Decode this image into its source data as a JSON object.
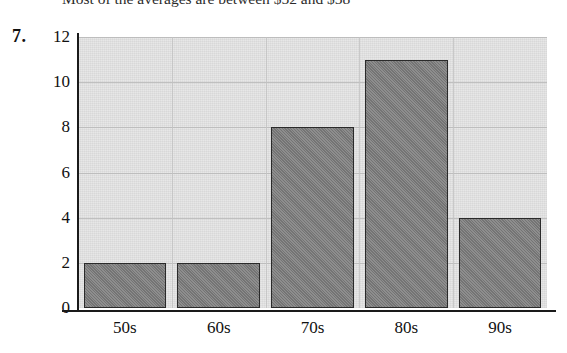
{
  "page": {
    "top_sentence": "Most of the averages are between $52 and $58",
    "problem_number": "7."
  },
  "chart_data": {
    "type": "bar",
    "title": "",
    "xlabel": "",
    "ylabel": "",
    "categories": [
      "50s",
      "60s",
      "70s",
      "80s",
      "90s"
    ],
    "values": [
      2,
      2,
      8,
      11,
      4
    ],
    "ylim": [
      0,
      12
    ],
    "yticks": [
      0,
      2,
      4,
      6,
      8,
      10,
      12
    ],
    "ytick_labels": [
      "0",
      "2",
      "4",
      "6",
      "8",
      "10",
      "12"
    ],
    "grid": true,
    "legend": null,
    "colors": {
      "bar_fill": "#7d7d7d",
      "bar_edge": "#2a2a2a",
      "plot_background": "#e7e7e7",
      "gridline": "#b9b9b9",
      "axis": "#1a1a1a",
      "text": "#111111"
    }
  }
}
